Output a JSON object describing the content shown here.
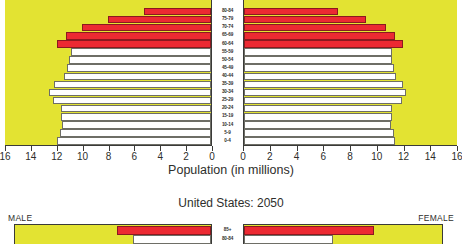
{
  "chart_data": [
    {
      "type": "bar",
      "orientation": "horizontal",
      "subtype": "population-pyramid",
      "title": "",
      "xlabel": "Population (in millions)",
      "ylabel": "",
      "xlim_left": [
        16,
        0
      ],
      "xlim_right": [
        0,
        16
      ],
      "xticks_left": [
        16,
        14,
        12,
        10,
        8,
        6,
        4,
        2,
        0
      ],
      "xticks_right": [
        0,
        2,
        4,
        6,
        8,
        10,
        12,
        14,
        16
      ],
      "grid": false,
      "legend": [],
      "plot_background_color": "#E3E332",
      "note": "Top pyramid is vertically cropped; rows above 80-84 are not visible.",
      "categories": [
        "80-84",
        "75-79",
        "70-74",
        "65-69",
        "60-64",
        "55-59",
        "50-54",
        "45-49",
        "40-44",
        "35-39",
        "30-34",
        "25-29",
        "20-24",
        "15-19",
        "10-14",
        "5-9",
        "0-4"
      ],
      "series": [
        {
          "name": "MALE",
          "side": "left",
          "values": [
            5.2,
            8.0,
            10.0,
            11.2,
            11.9,
            10.8,
            11.0,
            11.1,
            11.4,
            12.1,
            12.5,
            12.2,
            11.6,
            11.6,
            11.5,
            11.7,
            11.9
          ],
          "colors": [
            "#EC2A32",
            "#EC2A32",
            "#EC2A32",
            "#EC2A32",
            "#EC2A32",
            "#FFFFFF",
            "#FFFFFF",
            "#FFFFFF",
            "#FFFFFF",
            "#FFFFFF",
            "#FFFFFF",
            "#FFFFFF",
            "#FFFFFF",
            "#FFFFFF",
            "#FFFFFF",
            "#FFFFFF",
            "#FFFFFF"
          ]
        },
        {
          "name": "FEMALE",
          "side": "right",
          "values": [
            7.0,
            9.1,
            10.6,
            11.3,
            11.9,
            11.1,
            11.1,
            11.2,
            11.4,
            11.9,
            12.1,
            11.8,
            11.1,
            11.1,
            11.0,
            11.2,
            11.3
          ],
          "colors": [
            "#EC2A32",
            "#EC2A32",
            "#EC2A32",
            "#EC2A32",
            "#EC2A32",
            "#FFFFFF",
            "#FFFFFF",
            "#FFFFFF",
            "#FFFFFF",
            "#FFFFFF",
            "#FFFFFF",
            "#FFFFFF",
            "#FFFFFF",
            "#FFFFFF",
            "#FFFFFF",
            "#FFFFFF",
            "#FFFFFF"
          ]
        }
      ]
    },
    {
      "type": "bar",
      "orientation": "horizontal",
      "subtype": "population-pyramid",
      "title": "United States: 2050",
      "xlabel": "",
      "ylabel": "",
      "grid": false,
      "left_axis_label": "MALE",
      "right_axis_label": "FEMALE",
      "plot_background_color": "#E3E332",
      "note": "Second pyramid is cropped at the bottom of the screenshot; only the 85+ and 80-84 rows are visible.",
      "categories": [
        "85+",
        "80-84"
      ],
      "series": [
        {
          "name": "MALE",
          "side": "left",
          "values": [
            7.6,
            6.3
          ],
          "colors": [
            "#EC2A32",
            "#FFFFFF"
          ]
        },
        {
          "name": "FEMALE",
          "side": "right",
          "values": [
            10.4,
            7.1
          ],
          "colors": [
            "#EC2A32",
            "#FFFFFF"
          ]
        }
      ]
    }
  ],
  "top_chart": {
    "axis_title": "Population (in millions)",
    "ticks_left": [
      "16",
      "14",
      "12",
      "10",
      "8",
      "6",
      "4",
      "2",
      "0"
    ],
    "ticks_right": [
      "0",
      "2",
      "4",
      "6",
      "8",
      "10",
      "12",
      "14",
      "16"
    ],
    "age_labels": [
      "80-84",
      "75-79",
      "70-74",
      "65-69",
      "60-64",
      "55-59",
      "50-54",
      "45-49",
      "40-44",
      "35-39",
      "30-34",
      "25-29",
      "20-24",
      "15-19",
      "10-14",
      "5-9",
      "0-4"
    ]
  },
  "bottom_chart": {
    "title": "United States: 2050",
    "male_label": "MALE",
    "female_label": "FEMALE",
    "age_labels": [
      "85+",
      "80-84"
    ]
  },
  "colors": {
    "background_plot": "#E3E332",
    "bar_red": "#EC2A32",
    "bar_white": "#FFFFFF",
    "axis": "#3A3A38",
    "text": "#2E2E2C"
  }
}
